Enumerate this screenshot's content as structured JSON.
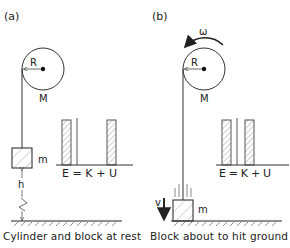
{
  "panels": [
    {
      "id": "a",
      "label": "(a)",
      "cylinder": {
        "radius_label": "R",
        "mass_label": "M"
      },
      "block": {
        "mass_label": "m"
      },
      "height_label": "h",
      "energy_equation": "E = K + U",
      "energy_bars": {
        "E": 1.0,
        "K": 0.0,
        "U": 1.0
      },
      "caption": "Cylinder and block at rest"
    },
    {
      "id": "b",
      "label": "(b)",
      "cylinder": {
        "radius_label": "R",
        "mass_label": "M",
        "angular_velocity_label": "ω"
      },
      "block": {
        "mass_label": "m",
        "velocity_label": "v"
      },
      "energy_equation": "E = K + U",
      "energy_bars": {
        "E": 1.0,
        "K": 1.0,
        "U": 0.0
      },
      "caption": "Block about to hit ground"
    }
  ],
  "colors": {
    "line": "#333333",
    "text": "#222222",
    "hatch": "#888888"
  }
}
